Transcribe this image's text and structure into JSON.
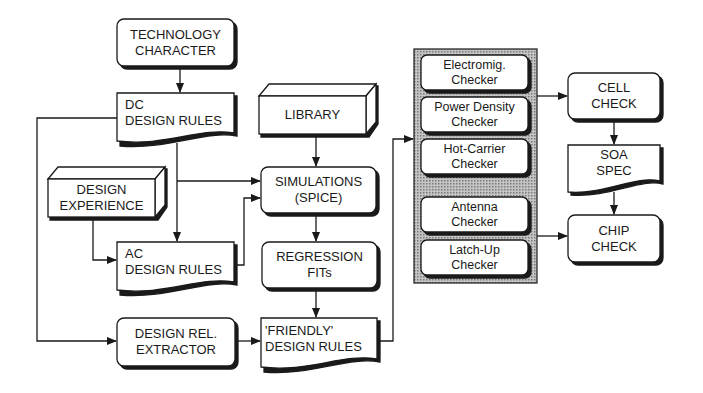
{
  "diagram": {
    "type": "flowchart",
    "nodes": {
      "technology_character": {
        "lines": [
          "TECHNOLOGY",
          "CHARACTER"
        ],
        "shape": "rounded-rect"
      },
      "dc_design_rules": {
        "lines": [
          "DC",
          "DESIGN RULES"
        ],
        "shape": "document"
      },
      "design_experience": {
        "lines": [
          "DESIGN",
          "EXPERIENCE"
        ],
        "shape": "3d-box"
      },
      "ac_design_rules": {
        "lines": [
          "AC",
          "DESIGN RULES"
        ],
        "shape": "document"
      },
      "design_rel_extractor": {
        "lines": [
          "DESIGN REL.",
          "EXTRACTOR"
        ],
        "shape": "rounded-rect"
      },
      "library": {
        "lines": [
          "LIBRARY"
        ],
        "shape": "3d-box"
      },
      "simulations": {
        "lines": [
          "SIMULATIONS",
          "(SPICE)"
        ],
        "shape": "rounded-rect"
      },
      "regression_fits": {
        "lines": [
          "REGRESSION",
          "FITs"
        ],
        "shape": "rounded-rect"
      },
      "friendly_design_rules": {
        "lines": [
          "'FRIENDLY'",
          "DESIGN RULES"
        ],
        "shape": "document"
      },
      "electromig_checker": {
        "lines": [
          "Electromig.",
          "Checker"
        ],
        "shape": "rounded-rect"
      },
      "power_density_checker": {
        "lines": [
          "Power Density",
          "Checker"
        ],
        "shape": "rounded-rect"
      },
      "hot_carrier_checker": {
        "lines": [
          "Hot-Carrier",
          "Checker"
        ],
        "shape": "rounded-rect"
      },
      "antenna_checker": {
        "lines": [
          "Antenna",
          "Checker"
        ],
        "shape": "rounded-rect"
      },
      "latch_up_checker": {
        "lines": [
          "Latch-Up",
          "Checker"
        ],
        "shape": "rounded-rect"
      },
      "cell_check": {
        "lines": [
          "CELL",
          "CHECK"
        ],
        "shape": "rounded-rect"
      },
      "soa_spec": {
        "lines": [
          "SOA",
          "SPEC"
        ],
        "shape": "document"
      },
      "chip_check": {
        "lines": [
          "CHIP",
          "CHECK"
        ],
        "shape": "rounded-rect"
      }
    },
    "edges": [
      [
        "technology_character",
        "dc_design_rules"
      ],
      [
        "dc_design_rules",
        "design_rel_extractor"
      ],
      [
        "dc_design_rules",
        "ac_design_rules"
      ],
      [
        "dc_design_rules",
        "simulations"
      ],
      [
        "design_experience",
        "ac_design_rules"
      ],
      [
        "ac_design_rules",
        "simulations"
      ],
      [
        "library",
        "simulations"
      ],
      [
        "simulations",
        "regression_fits"
      ],
      [
        "regression_fits",
        "friendly_design_rules"
      ],
      [
        "design_rel_extractor",
        "friendly_design_rules"
      ],
      [
        "friendly_design_rules",
        "checker_group"
      ],
      [
        "checker_group",
        "cell_check"
      ],
      [
        "checker_group",
        "chip_check"
      ],
      [
        "cell_check",
        "soa_spec"
      ],
      [
        "soa_spec",
        "chip_check"
      ]
    ],
    "colors": {
      "line": "#1a1a1a",
      "panel_fill": "#a8a8a8",
      "box_fill": "#ffffff"
    }
  }
}
